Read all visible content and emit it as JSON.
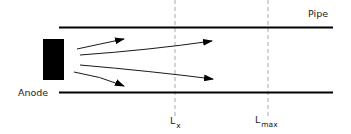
{
  "diagram": {
    "labels": {
      "pipe": "Pipe",
      "anode": "Anode",
      "lx_main": "L",
      "lx_sub": "x",
      "lmax_main": "L",
      "lmax_sub": "max"
    },
    "colors": {
      "line": "#000000",
      "dashed": "#aaaaaa",
      "text": "#222222"
    },
    "elements": {
      "pipe_walls": 2,
      "anode_block": 1,
      "flow_arrows": 4,
      "reference_lines": [
        "Lx",
        "Lmax"
      ]
    }
  }
}
